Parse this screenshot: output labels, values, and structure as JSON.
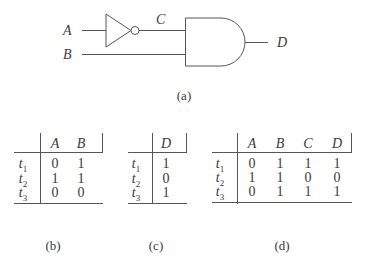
{
  "circuit": {
    "inputs": [
      "A",
      "B"
    ],
    "intermediate": "C",
    "output": "D",
    "gates": [
      "NOT",
      "AND"
    ],
    "caption": "(a)"
  },
  "tables": {
    "b": {
      "caption": "(b)",
      "columns": [
        "A",
        "B"
      ],
      "rows": [
        {
          "label": "t",
          "sub": "1",
          "values": [
            "0",
            "1"
          ]
        },
        {
          "label": "t",
          "sub": "2",
          "values": [
            "1",
            "1"
          ]
        },
        {
          "label": "t",
          "sub": "3",
          "values": [
            "0",
            "0"
          ]
        }
      ]
    },
    "c": {
      "caption": "(c)",
      "columns": [
        "D"
      ],
      "rows": [
        {
          "label": "t",
          "sub": "1",
          "values": [
            "1"
          ]
        },
        {
          "label": "t",
          "sub": "2",
          "values": [
            "0"
          ]
        },
        {
          "label": "t",
          "sub": "3",
          "values": [
            "1"
          ]
        }
      ]
    },
    "d": {
      "caption": "(d)",
      "columns": [
        "A",
        "B",
        "C",
        "D"
      ],
      "rows": [
        {
          "label": "t",
          "sub": "1",
          "values": [
            "0",
            "1",
            "1",
            "1"
          ]
        },
        {
          "label": "t",
          "sub": "2",
          "values": [
            "1",
            "1",
            "0",
            "0"
          ]
        },
        {
          "label": "t",
          "sub": "3",
          "values": [
            "0",
            "1",
            "1",
            "1"
          ]
        }
      ]
    }
  }
}
